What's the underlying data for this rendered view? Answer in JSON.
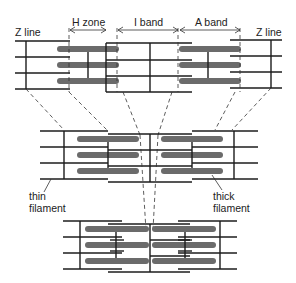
{
  "diagram": {
    "labels": {
      "z_line_left": "Z line",
      "z_line_right": "Z line",
      "h_zone": "H zone",
      "i_band": "I band",
      "a_band": "A band",
      "thin_filament_1": "thin",
      "thin_filament_2": "filament",
      "thick_filament_1": "thick",
      "thick_filament_2": "filament"
    },
    "stages": [
      {
        "name": "relaxed",
        "position": "top"
      },
      {
        "name": "partially-contracted",
        "position": "middle"
      },
      {
        "name": "fully-contracted",
        "position": "bottom"
      }
    ],
    "colors": {
      "thick_filament": "#6b6b6b",
      "thin_filament": "#1c1c1c",
      "background": "#ffffff"
    }
  }
}
